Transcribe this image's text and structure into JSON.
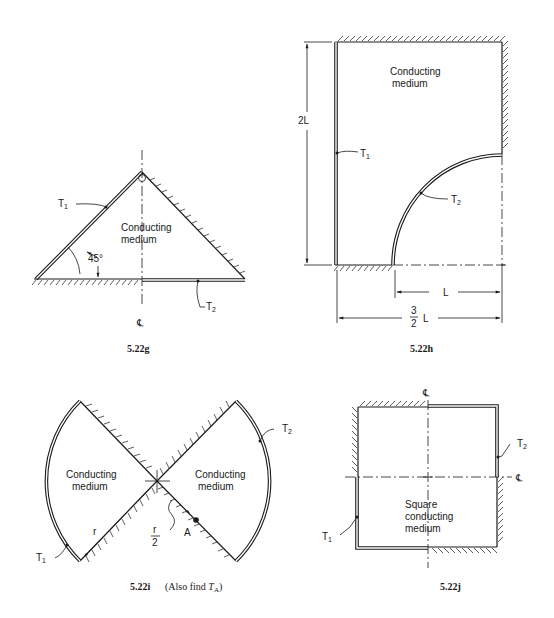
{
  "figures": {
    "g": {
      "caption": "5.22g",
      "medium_line1": "Conducting",
      "medium_line2": "medium",
      "t1": "T",
      "t1_sub": "1",
      "t2": "T",
      "t2_sub": "2",
      "angle": "45°",
      "centerline": "℄"
    },
    "h": {
      "caption": "5.22h",
      "medium_line1": "Conducting",
      "medium_line2": "medium",
      "t1": "T",
      "t1_sub": "1",
      "t2": "T",
      "t2_sub": "2",
      "dim_height": "2L",
      "dim_l": "L",
      "dim_frac_num": "3",
      "dim_frac_den": "2",
      "dim_frac_unit": "L"
    },
    "i": {
      "caption": "5.22i",
      "caption_note_prefix": "(Also find ",
      "caption_note_var": "T",
      "caption_note_sub": "A",
      "caption_note_suffix": ")",
      "left_medium_line1": "Conducting",
      "left_medium_line2": "medium",
      "right_medium_line1": "Conducting",
      "right_medium_line2": "medium",
      "t1": "T",
      "t1_sub": "1",
      "t2": "T",
      "t2_sub": "2",
      "radius_label": "r",
      "half_num": "r",
      "half_den": "2",
      "point_label": "A"
    },
    "j": {
      "caption": "5.22j",
      "medium_line1": "Square",
      "medium_line2": "conducting",
      "medium_line3": "medium",
      "t1": "T",
      "t1_sub": "1",
      "t2": "T",
      "t2_sub": "2",
      "centerline_v": "℄",
      "centerline_h": "℄"
    }
  }
}
